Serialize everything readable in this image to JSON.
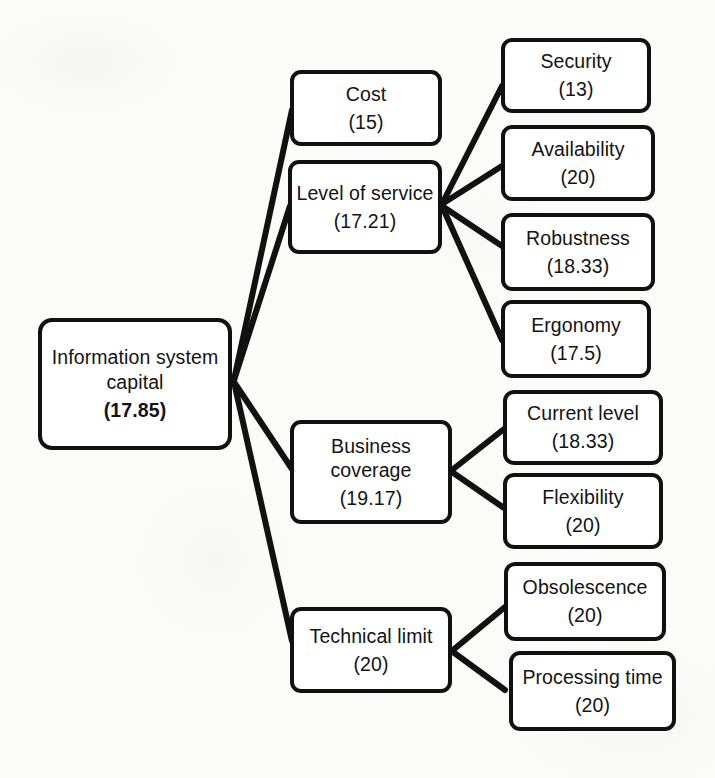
{
  "diagram": {
    "line_color": "#111111",
    "box_border_color": "#111111",
    "box_fill_color": "#ffffff",
    "background_color": "#fbfbf9"
  },
  "nodes": {
    "root": {
      "label_line1": "Information system",
      "label_line2": "capital",
      "value": "(17.85)"
    },
    "level1": [
      {
        "id": "cost",
        "label_line1": "Cost",
        "label_line2": "",
        "value": "(15)"
      },
      {
        "id": "level-of-service",
        "label_line1": "Level of service",
        "label_line2": "",
        "value": "(17.21)"
      },
      {
        "id": "business-coverage",
        "label_line1": "Business",
        "label_line2": "coverage",
        "value": "(19.17)"
      },
      {
        "id": "technical-limit",
        "label_line1": "Technical limit",
        "label_line2": "",
        "value": "(20)"
      }
    ],
    "level2": [
      {
        "id": "security",
        "label": "Security",
        "value": "(13)"
      },
      {
        "id": "availability",
        "label": "Availability",
        "value": "(20)"
      },
      {
        "id": "robustness",
        "label": "Robustness",
        "value": "(18.33)"
      },
      {
        "id": "ergonomy",
        "label": "Ergonomy",
        "value": "(17.5)"
      },
      {
        "id": "current-level",
        "label": "Current level",
        "value": "(18.33)"
      },
      {
        "id": "flexibility",
        "label": "Flexibility",
        "value": "(20)"
      },
      {
        "id": "obsolescence",
        "label": "Obsolescence",
        "value": "(20)"
      },
      {
        "id": "processing-time",
        "label": "Processing time",
        "value": "(20)"
      }
    ]
  },
  "edges": [
    {
      "from": "root",
      "to": "cost"
    },
    {
      "from": "root",
      "to": "level-of-service"
    },
    {
      "from": "root",
      "to": "business-coverage"
    },
    {
      "from": "root",
      "to": "technical-limit"
    },
    {
      "from": "level-of-service",
      "to": "security"
    },
    {
      "from": "level-of-service",
      "to": "availability"
    },
    {
      "from": "level-of-service",
      "to": "robustness"
    },
    {
      "from": "level-of-service",
      "to": "ergonomy"
    },
    {
      "from": "business-coverage",
      "to": "current-level"
    },
    {
      "from": "business-coverage",
      "to": "flexibility"
    },
    {
      "from": "technical-limit",
      "to": "obsolescence"
    },
    {
      "from": "technical-limit",
      "to": "processing-time"
    }
  ]
}
